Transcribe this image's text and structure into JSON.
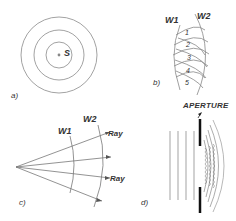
{
  "figure": {
    "panels": [
      {
        "id": "a",
        "label": "a)",
        "source_label": "S",
        "description": "concentric circular wavefronts around point source"
      },
      {
        "id": "b",
        "label": "b)",
        "wavefront_labels": [
          "W1",
          "W2"
        ],
        "point_labels": [
          "1",
          "2",
          "3",
          "4",
          "5"
        ],
        "description": "Huygens secondary wavelets from W1 forming W2"
      },
      {
        "id": "c",
        "label": "c)",
        "wavefront_labels": [
          "W1",
          "W2"
        ],
        "ray_labels": [
          "Ray",
          "Ray"
        ],
        "description": "rays perpendicular to spherical wavefronts"
      },
      {
        "id": "d",
        "label": "d)",
        "aperture_label": "APERTURE",
        "description": "plane waves diffracting through aperture"
      }
    ],
    "colors": {
      "line": "#8a8a8a",
      "dark": "#222222",
      "text": "#333333"
    }
  }
}
